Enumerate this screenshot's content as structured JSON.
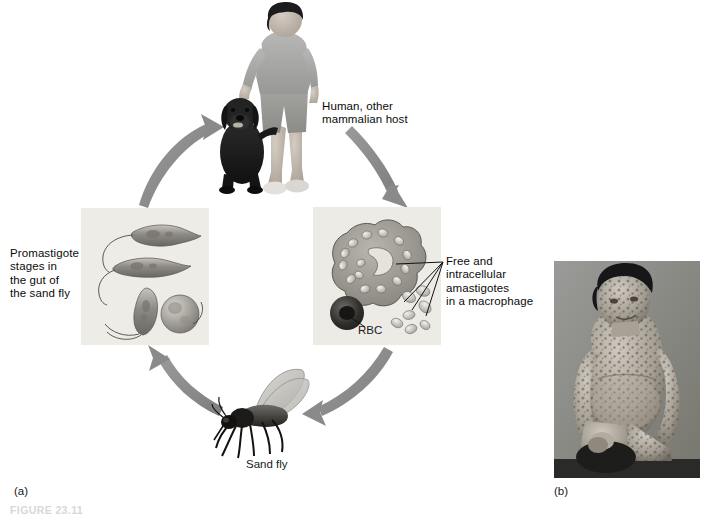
{
  "figure": {
    "caption_cut": "FIGURE 23.11",
    "panel_a_label": "(a)",
    "panel_b_label": "(b)"
  },
  "cycle": {
    "title": "Leishmania life cycle",
    "labels": {
      "host": "Human, other\nmammalian host",
      "promastigote": "Promastigote\nstages in\nthe gut of\nthe sand fly",
      "amastigote": "Free and\nintracellular\namastigotes\nin a macrophage",
      "rbc": "RBC",
      "vector": "Sand fly"
    },
    "nodes": [
      {
        "name": "human-host-image",
        "alt": "Boy standing with a black dog"
      },
      {
        "name": "macrophage-illustration",
        "alt": "Macrophage containing amastigotes beside a red blood cell"
      },
      {
        "name": "sandfly-illustration",
        "alt": "Sand fly with wings raised"
      },
      {
        "name": "promastigote-illustration",
        "alt": "Four flagellated promastigote stages"
      }
    ],
    "arrows": [
      {
        "name": "arrow-host-to-macrophage",
        "from": "human-host-image",
        "to": "macrophage-illustration"
      },
      {
        "name": "arrow-macrophage-to-sandfly",
        "from": "macrophage-illustration",
        "to": "sandfly-illustration"
      },
      {
        "name": "arrow-sandfly-to-promastigote",
        "from": "sandfly-illustration",
        "to": "promastigote-illustration"
      },
      {
        "name": "arrow-promastigote-to-host",
        "from": "promastigote-illustration",
        "to": "human-host-image"
      }
    ]
  },
  "photo": {
    "name": "patient-photograph",
    "alt": "Seated patient with diffuse cutaneous leishmaniasis lesions over face, trunk and limbs"
  },
  "colors": {
    "arrow": "#8a8a8a",
    "panel_bg": "#efeeea",
    "panel_border": "#c9c7c1",
    "text": "#0b0b0b",
    "photo_bg": "#8e8e8e"
  }
}
